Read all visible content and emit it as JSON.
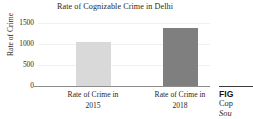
{
  "chart_data": {
    "type": "bar",
    "title": "Rate of Cognizable Crime in Delhi",
    "xlabel": "",
    "ylabel": "Rate of Crime",
    "categories": [
      "Rate of Crime in 2015",
      "Rate of Crime in 2018"
    ],
    "category_lines": [
      {
        "line1": "Rate of Crime in",
        "line2": "2015"
      },
      {
        "line1": "Rate of Crime in",
        "line2": "2018"
      }
    ],
    "values": [
      1050,
      1380
    ],
    "ylim": [
      0,
      1500
    ],
    "yticks": [
      1500,
      1000,
      500,
      0
    ],
    "ytick_labels": [
      "1500",
      "1000",
      "500",
      "0"
    ],
    "grid": true,
    "legend": false,
    "bar_colors": [
      "#d9d9d9",
      "#7f7f7f"
    ]
  },
  "caption": {
    "fig_label": "FIG",
    "line_1": "Cop",
    "line_2": "Sou"
  },
  "colors": {
    "bar_light": "#d9d9d9",
    "bar_dark": "#7f7f7f",
    "axis": "#8c8c8c",
    "grid": "#f0f0f0",
    "text": "#2b2725"
  }
}
